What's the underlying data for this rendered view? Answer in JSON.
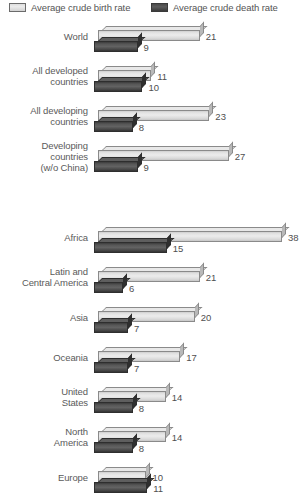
{
  "legend": {
    "birth": {
      "label": "Average crude birth rate",
      "swatch": "light-gray-bar-swatch",
      "color": "#e6e6e6"
    },
    "death": {
      "label": "Average crude death rate",
      "swatch": "dark-gray-bar-swatch",
      "color": "#4f4f4f"
    }
  },
  "chart_data": {
    "type": "bar",
    "orientation": "horizontal",
    "title": "",
    "subtitle": "",
    "xlabel": "",
    "ylabel": "",
    "xlim": [
      0,
      38
    ],
    "grid": false,
    "legend_position": "top",
    "series": [
      {
        "name": "Average crude birth rate",
        "color": "#e6e6e6",
        "values": [
          21,
          11,
          23,
          27,
          38,
          21,
          20,
          17,
          14,
          14,
          10
        ]
      },
      {
        "name": "Average crude death rate",
        "color": "#4f4f4f",
        "values": [
          9,
          10,
          8,
          9,
          15,
          6,
          7,
          7,
          8,
          8,
          11
        ]
      }
    ],
    "categories": [
      "World",
      "All developed countries",
      "All developing countries",
      "Developing countries (w/o China)",
      "Africa",
      "Latin and Central America",
      "Asia",
      "Oceania",
      "United States",
      "North America",
      "Europe"
    ],
    "groups": [
      {
        "id": "group-1",
        "rows": [
          {
            "label_lines": [
              "World"
            ],
            "birth": 21,
            "death": 9
          },
          {
            "label_lines": [
              "All developed",
              "countries"
            ],
            "birth": 11,
            "death": 10
          },
          {
            "label_lines": [
              "All developing",
              "countries"
            ],
            "birth": 23,
            "death": 8
          },
          {
            "label_lines": [
              "Developing",
              "countries",
              "(w/o China)"
            ],
            "birth": 27,
            "death": 9
          }
        ]
      },
      {
        "id": "group-2",
        "rows": [
          {
            "label_lines": [
              "Africa"
            ],
            "birth": 38,
            "death": 15
          },
          {
            "label_lines": [
              "Latin and",
              "Central America"
            ],
            "birth": 21,
            "death": 6
          },
          {
            "label_lines": [
              "Asia"
            ],
            "birth": 20,
            "death": 7
          },
          {
            "label_lines": [
              "Oceania"
            ],
            "birth": 17,
            "death": 7
          },
          {
            "label_lines": [
              "United",
              "States"
            ],
            "birth": 14,
            "death": 8
          },
          {
            "label_lines": [
              "North",
              "America"
            ],
            "birth": 14,
            "death": 8
          },
          {
            "label_lines": [
              "Europe"
            ],
            "birth": 10,
            "death": 11
          }
        ]
      }
    ]
  }
}
